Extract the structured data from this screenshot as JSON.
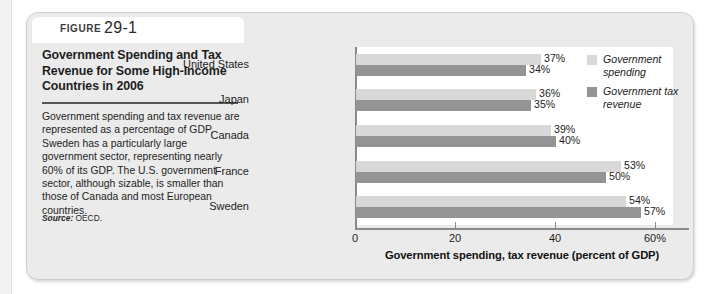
{
  "figure": {
    "tag": "FIGURE",
    "number": "29-1",
    "title": "Government Spending and Tax Revenue for Some High-Income Countries in 2006",
    "body": "Government spending and tax revenue are represented as a percentage of GDP. Sweden has a particularly large government sector, representing nearly 60% of its GDP. The U.S. government sector, although sizable, is smaller than those of Canada and most European countries.",
    "source_label": "Source:",
    "source_value": "OECD."
  },
  "chart_data": {
    "type": "bar",
    "orientation": "horizontal",
    "title": "",
    "xlabel": "Government spending, tax revenue (percent of GDP)",
    "ylabel": "",
    "categories": [
      "United States",
      "Japan",
      "Canada",
      "France",
      "Sweden"
    ],
    "series": [
      {
        "name": "Government spending",
        "color": "#d8d8d8",
        "values": [
          37,
          36,
          39,
          53,
          54
        ],
        "labels": [
          "37%",
          "36%",
          "39%",
          "53%",
          "54%"
        ]
      },
      {
        "name": "Government tax revenue",
        "color": "#949494",
        "values": [
          34,
          35,
          40,
          50,
          57
        ],
        "labels": [
          "34%",
          "35%",
          "40%",
          "50%",
          "57%"
        ]
      }
    ],
    "xlim": [
      0,
      65
    ],
    "xticks": [
      0,
      20,
      40,
      60
    ],
    "xtick_labels": [
      "0",
      "20",
      "40",
      "60%"
    ],
    "grid": false,
    "legend_position": "top-right"
  }
}
